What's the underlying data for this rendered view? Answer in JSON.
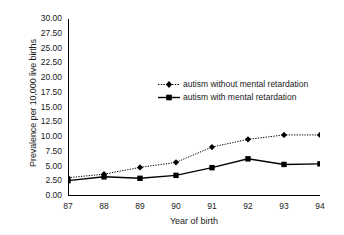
{
  "chart_data": {
    "type": "line",
    "title": "",
    "xlabel": "Year of birth",
    "ylabel": "Prevalence per 10,000 live births",
    "categories": [
      "87",
      "88",
      "89",
      "90",
      "91",
      "92",
      "93",
      "94"
    ],
    "x": [
      87,
      88,
      89,
      90,
      91,
      92,
      93,
      94
    ],
    "xlim": [
      87,
      94
    ],
    "ylim": [
      0,
      30
    ],
    "ytick_labels": [
      "0.00",
      "2.50",
      "5.00",
      "7.50",
      "10.00",
      "12.50",
      "15.00",
      "17.50",
      "20.00",
      "22.50",
      "25.00",
      "27.50",
      "30.00"
    ],
    "ytick_values": [
      0,
      2.5,
      5,
      7.5,
      10,
      12.5,
      15,
      17.5,
      20,
      22.5,
      25,
      27.5,
      30
    ],
    "xtick_labels": [
      "87",
      "88",
      "89",
      "90",
      "91",
      "92",
      "93",
      "94"
    ],
    "grid": false,
    "legend_position": "center",
    "series": [
      {
        "name": "autism without mental retardation",
        "values": [
          3.1,
          3.7,
          4.85,
          5.7,
          8.3,
          9.6,
          10.35,
          10.35
        ],
        "marker": "diamond",
        "line_style": "dotted",
        "color": "#000000"
      },
      {
        "name": "autism with mental retardation",
        "values": [
          2.6,
          3.25,
          3.0,
          3.5,
          4.8,
          6.3,
          5.35,
          5.45
        ],
        "marker": "square",
        "line_style": "solid",
        "color": "#000000"
      }
    ]
  },
  "legend": {
    "items": [
      {
        "label": "autism without mental retardation"
      },
      {
        "label": "autism with mental retardation"
      }
    ]
  },
  "axes": {
    "y_title": "Prevalence per 10,000 live births",
    "x_title": "Year of birth"
  }
}
